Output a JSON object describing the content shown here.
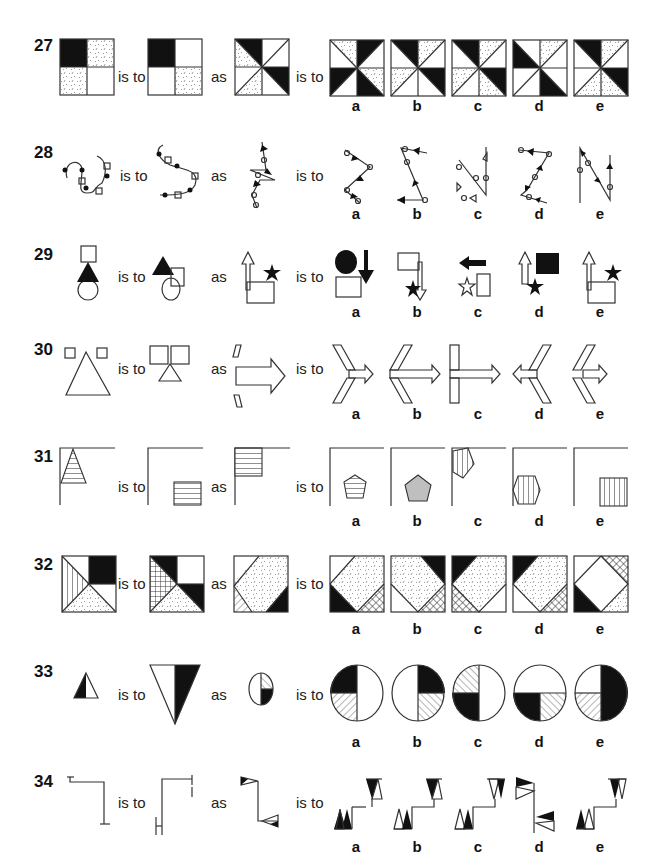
{
  "page": {
    "type": "non-verbal reasoning analogies",
    "connectors": {
      "is_to": "is to",
      "as": "as"
    },
    "option_labels": [
      "a",
      "b",
      "c",
      "d",
      "e"
    ]
  },
  "questions": [
    {
      "number": "27",
      "y": 35
    },
    {
      "number": "28",
      "y": 140
    },
    {
      "number": "29",
      "y": 245
    },
    {
      "number": "30",
      "y": 340
    },
    {
      "number": "31",
      "y": 445
    },
    {
      "number": "32",
      "y": 552
    },
    {
      "number": "33",
      "y": 660
    },
    {
      "number": "34",
      "y": 772
    }
  ],
  "colors": {
    "ink": "#111111",
    "grey_fill": "#bfbfbf",
    "line": "#333333"
  }
}
